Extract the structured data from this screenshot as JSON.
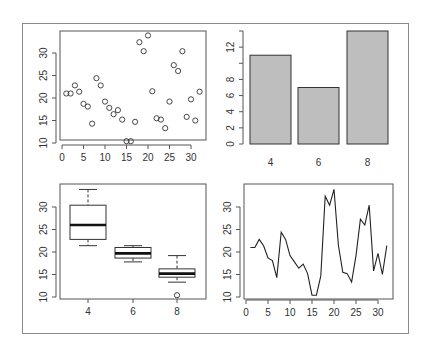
{
  "chart_data": [
    {
      "type": "scatter",
      "title": "",
      "xlabel": "",
      "ylabel": "",
      "x_ticks": [
        0,
        5,
        10,
        15,
        20,
        25,
        30
      ],
      "y_ticks": [
        10,
        15,
        20,
        25,
        30
      ],
      "xlim": [
        0,
        32
      ],
      "ylim": [
        10.4,
        33.9
      ],
      "marker": "open-circle",
      "x": [
        1,
        2,
        3,
        4,
        5,
        6,
        7,
        8,
        9,
        10,
        11,
        12,
        13,
        14,
        15,
        16,
        17,
        18,
        19,
        20,
        21,
        22,
        23,
        24,
        25,
        26,
        27,
        28,
        29,
        30,
        31,
        32
      ],
      "values": [
        21.0,
        21.0,
        22.8,
        21.4,
        18.7,
        18.1,
        14.3,
        24.4,
        22.8,
        19.2,
        17.8,
        16.4,
        17.3,
        15.2,
        10.4,
        10.4,
        14.7,
        32.4,
        30.4,
        33.9,
        21.5,
        15.5,
        15.2,
        13.3,
        19.2,
        27.3,
        26.0,
        30.4,
        15.8,
        19.7,
        15.0,
        21.4
      ]
    },
    {
      "type": "bar",
      "title": "",
      "xlabel": "",
      "ylabel": "",
      "categories": [
        "4",
        "6",
        "8"
      ],
      "values": [
        11,
        7,
        14
      ],
      "y_ticks": [
        0,
        2,
        4,
        6,
        8,
        12
      ],
      "ylim": [
        0,
        14
      ],
      "bar_color": "#bebebe"
    },
    {
      "type": "box",
      "title": "",
      "xlabel": "",
      "ylabel": "",
      "categories": [
        "4",
        "6",
        "8"
      ],
      "y_ticks": [
        10,
        15,
        20,
        25,
        30
      ],
      "ylim": [
        10.4,
        33.9
      ],
      "boxes": [
        {
          "min": 21.4,
          "q1": 22.8,
          "median": 26.0,
          "q3": 30.4,
          "max": 33.9,
          "outliers": []
        },
        {
          "min": 17.8,
          "q1": 18.65,
          "median": 19.7,
          "q3": 21.0,
          "max": 21.4,
          "outliers": []
        },
        {
          "min": 13.3,
          "q1": 14.4,
          "median": 15.2,
          "q3": 16.25,
          "max": 19.2,
          "outliers": [
            10.4
          ]
        }
      ]
    },
    {
      "type": "line",
      "title": "",
      "xlabel": "",
      "ylabel": "",
      "x_ticks": [
        0,
        5,
        10,
        15,
        20,
        25,
        30
      ],
      "y_ticks": [
        10,
        15,
        20,
        25,
        30
      ],
      "xlim": [
        0,
        32
      ],
      "ylim": [
        10.4,
        33.9
      ],
      "x": [
        1,
        2,
        3,
        4,
        5,
        6,
        7,
        8,
        9,
        10,
        11,
        12,
        13,
        14,
        15,
        16,
        17,
        18,
        19,
        20,
        21,
        22,
        23,
        24,
        25,
        26,
        27,
        28,
        29,
        30,
        31,
        32
      ],
      "values": [
        21.0,
        21.0,
        22.8,
        21.4,
        18.7,
        18.1,
        14.3,
        24.4,
        22.8,
        19.2,
        17.8,
        16.4,
        17.3,
        15.2,
        10.4,
        10.4,
        14.7,
        32.4,
        30.4,
        33.9,
        21.5,
        15.5,
        15.2,
        13.3,
        19.2,
        27.3,
        26.0,
        30.4,
        15.8,
        19.7,
        15.0,
        21.4
      ]
    }
  ]
}
